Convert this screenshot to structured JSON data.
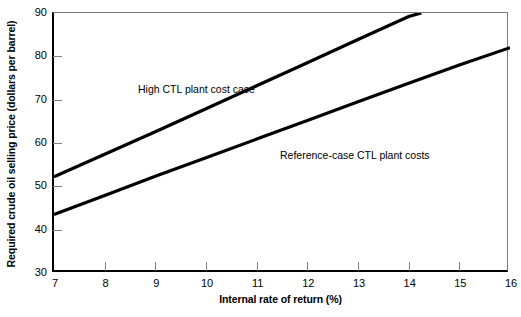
{
  "chart_data": {
    "type": "line",
    "title": "",
    "xlabel": "Internal rate of return (%)",
    "ylabel": "Required crude oil selling price (dollars per barrel)",
    "xlim": [
      7,
      16
    ],
    "ylim": [
      30,
      90
    ],
    "xticks": [
      7,
      8,
      9,
      10,
      11,
      12,
      13,
      14,
      15,
      16
    ],
    "yticks": [
      30,
      40,
      50,
      60,
      70,
      80,
      90
    ],
    "xtick_labels": [
      "7",
      "8",
      "9",
      "10",
      "11",
      "12",
      "13",
      "14",
      "15",
      "16"
    ],
    "ytick_labels": [
      "30",
      "40",
      "50",
      "60",
      "70",
      "80",
      "90"
    ],
    "grid": false,
    "legend_position": "inline-annotation",
    "line_color": "#000000",
    "series": [
      {
        "name": "High CTL plant cost case",
        "x": [
          7,
          8,
          9,
          10,
          11,
          12,
          13,
          14,
          14.25
        ],
        "values": [
          52.2,
          57.4,
          62.6,
          67.9,
          73.2,
          78.5,
          83.9,
          89.2,
          90.0
        ],
        "label_text": "High CTL plant cost case"
      },
      {
        "name": "Reference-case CTL plant costs",
        "x": [
          7,
          8,
          9,
          10,
          11,
          12,
          13,
          14,
          15,
          16
        ],
        "values": [
          43.5,
          47.9,
          52.3,
          56.6,
          60.9,
          65.2,
          69.5,
          73.8,
          78.0,
          82.0
        ],
        "label_text": "Reference-case CTL plant costs"
      }
    ],
    "annotations": [
      {
        "text": "High CTL plant cost case",
        "x": 8.6,
        "y": 71.5
      },
      {
        "text": "Reference-case CTL plant costs",
        "x": 11.4,
        "y": 56.0
      }
    ]
  }
}
